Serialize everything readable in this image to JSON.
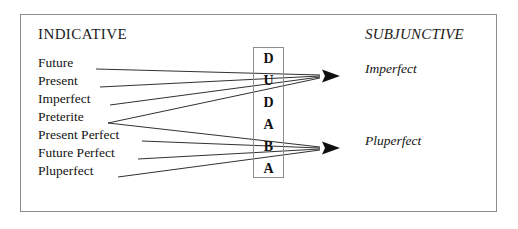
{
  "diagram": {
    "title_left": "INDICATIVE",
    "title_right": "SUBJUNCTIVE",
    "frame_color": "#8d8d8d",
    "line_color": "#1a1a1a",
    "background": "#ffffff"
  },
  "indicative": {
    "items": [
      {
        "label": "Future",
        "y": 66
      },
      {
        "label": "Present",
        "y": 84
      },
      {
        "label": "Imperfect",
        "y": 102
      },
      {
        "label": "Preterite",
        "y": 120
      },
      {
        "label": "Present Perfect",
        "y": 138
      },
      {
        "label": "Future Perfect",
        "y": 156
      },
      {
        "label": "Pluperfect",
        "y": 174
      }
    ]
  },
  "mnemonic": {
    "word": "DUDABA",
    "letters": [
      {
        "letter": "D",
        "y": 52
      },
      {
        "letter": "U",
        "y": 74
      },
      {
        "letter": "D",
        "y": 96
      },
      {
        "letter": "A",
        "y": 118
      },
      {
        "letter": "B",
        "y": 140
      },
      {
        "letter": "A",
        "y": 162
      }
    ]
  },
  "subjunctive": {
    "items": [
      {
        "label": "Imperfect",
        "y": 72
      },
      {
        "label": "Pluperfect",
        "y": 144
      }
    ]
  },
  "connections": {
    "to_imperfect": [
      {
        "from": "Future",
        "x1": 96,
        "y1": 69,
        "x2": 320,
        "y2": 75
      },
      {
        "from": "Present",
        "x1": 100,
        "y1": 87,
        "x2": 320,
        "y2": 76
      },
      {
        "from": "Imperfect",
        "x1": 110,
        "y1": 105,
        "x2": 320,
        "y2": 77
      },
      {
        "from": "Preterite",
        "x1": 108,
        "y1": 123,
        "x2": 320,
        "y2": 78
      }
    ],
    "to_pluperfect": [
      {
        "from": "Preterite",
        "x1": 108,
        "y1": 123,
        "x2": 320,
        "y2": 147
      },
      {
        "from": "Present Perfect",
        "x1": 142,
        "y1": 141,
        "x2": 320,
        "y2": 148
      },
      {
        "from": "Future Perfect",
        "x1": 138,
        "y1": 159,
        "x2": 320,
        "y2": 149
      },
      {
        "from": "Pluperfect",
        "x1": 118,
        "y1": 177,
        "x2": 320,
        "y2": 150
      }
    ],
    "arrowheads": [
      {
        "target": "Imperfect",
        "x": 322,
        "y": 76
      },
      {
        "target": "Pluperfect",
        "x": 322,
        "y": 148
      }
    ]
  }
}
